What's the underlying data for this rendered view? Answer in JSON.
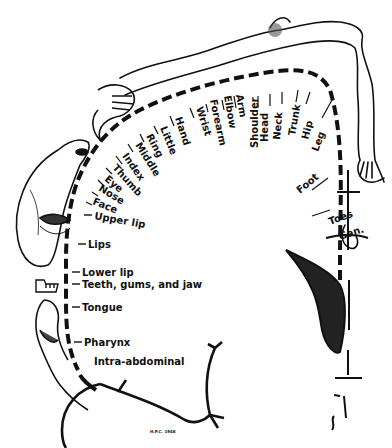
{
  "figure": {
    "ink_color": "#111111",
    "background": "#ffffff",
    "signature": "H.P.C. 1948"
  },
  "labels": {
    "gen": "Gen.",
    "toes": "Toes",
    "foot": "Foot",
    "leg": "Leg",
    "hip": "Hip",
    "trunk": "Trunk",
    "neck": "Neck",
    "head": "Head",
    "shoulder": "Shoulder",
    "arm": "Arm",
    "elbow": "Elbow",
    "forearm": "Forearm",
    "wrist": "Wrist",
    "hand": "Hand",
    "little": "Little",
    "ring": "Ring",
    "middle": "Middle",
    "index": "Index",
    "thumb": "Thumb",
    "eye": "Eye",
    "nose": "Nose",
    "face": "Face",
    "upper_lip": "Upper lip",
    "lips": "Lips",
    "lower_lip": "Lower lip",
    "teeth": "Teeth, gums, and jaw",
    "tongue": "Tongue",
    "pharynx": "Pharynx",
    "intra_abdominal": "Intra-abdominal"
  }
}
